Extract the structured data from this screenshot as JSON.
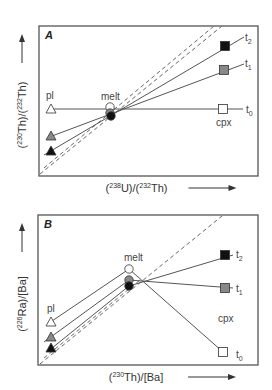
{
  "panels": [
    {
      "id": "A",
      "label": "A",
      "frame": {
        "x": 39,
        "y": 26,
        "w": 219,
        "h": 150
      },
      "xlabel": {
        "parts": [
          "(",
          "238",
          "U)/(",
          "232",
          "Th)"
        ]
      },
      "ylabel": {
        "parts": [
          "(",
          "230",
          "Th)/(",
          "232",
          "Th)"
        ]
      },
      "labels": {
        "pl": "pl",
        "melt": "melt",
        "cpx": "cpx",
        "t0": "t",
        "t1": "t",
        "t2": "t",
        "sub0": "0",
        "sub1": "1",
        "sub2": "2"
      },
      "dashed_lines": [
        {
          "x1": 40,
          "y1": 174,
          "x2": 222,
          "y2": 26
        },
        {
          "x1": 44,
          "y1": 168,
          "x2": 214,
          "y2": 26
        }
      ],
      "tie_lines": [
        {
          "name": "t0",
          "x1": 51,
          "y1": 109,
          "x2": 243,
          "y2": 109
        },
        {
          "name": "t1",
          "x1": 52,
          "y1": 136,
          "x2": 244,
          "y2": 64
        },
        {
          "name": "t2",
          "x1": 44,
          "y1": 155,
          "x2": 244,
          "y2": 37
        }
      ],
      "markers": [
        {
          "shape": "triangle",
          "fill": "#ffffff",
          "x": 51,
          "y": 109,
          "role": "pl-t0"
        },
        {
          "shape": "triangle",
          "fill": "#888888",
          "x": 51,
          "y": 136,
          "role": "pl-t1"
        },
        {
          "shape": "triangle",
          "fill": "#111111",
          "x": 51,
          "y": 151,
          "role": "pl-t2"
        },
        {
          "shape": "circle",
          "fill": "#ffffff",
          "x": 110,
          "y": 107,
          "role": "melt-t0"
        },
        {
          "shape": "circle",
          "fill": "#888888",
          "x": 110,
          "y": 113,
          "role": "melt-t1"
        },
        {
          "shape": "circle",
          "fill": "#111111",
          "x": 111,
          "y": 116,
          "role": "melt-t2"
        },
        {
          "shape": "square",
          "fill": "#ffffff",
          "x": 223,
          "y": 109,
          "role": "cpx-t0"
        },
        {
          "shape": "square",
          "fill": "#888888",
          "x": 224,
          "y": 70,
          "role": "cpx-t1"
        },
        {
          "shape": "square",
          "fill": "#111111",
          "x": 225,
          "y": 46,
          "role": "cpx-t2"
        }
      ],
      "text_positions": {
        "pl": [
          46,
          99
        ],
        "melt": [
          101,
          100
        ],
        "cpx": [
          216,
          126
        ],
        "t0": [
          246,
          113
        ],
        "t1": [
          245,
          67
        ],
        "t2": [
          245,
          41
        ]
      }
    },
    {
      "id": "B",
      "label": "B",
      "frame": {
        "x": 38,
        "y": 215,
        "w": 220,
        "h": 150
      },
      "xlabel": {
        "parts": [
          "(",
          "230",
          "Th)/[Ba]"
        ]
      },
      "ylabel": {
        "parts": [
          "(",
          "226",
          "Ra)/[Ba]"
        ]
      },
      "labels": {
        "pl": "pl",
        "melt": "melt",
        "cpx": "cpx",
        "t0": "t",
        "t1": "t",
        "t2": "t",
        "sub0": "0",
        "sub1": "1",
        "sub2": "2"
      },
      "dashed_lines": [
        {
          "x1": 40,
          "y1": 364,
          "x2": 222,
          "y2": 216
        },
        {
          "x1": 44,
          "y1": 358,
          "x2": 140,
          "y2": 280
        }
      ],
      "tie_lines": [
        {
          "name": "melt-pl-t0",
          "x1": 52,
          "y1": 321,
          "x2": 129,
          "y2": 269
        },
        {
          "name": "melt-pl-t1",
          "x1": 44,
          "y1": 342,
          "x2": 129,
          "y2": 280
        },
        {
          "name": "melt-pl-t2",
          "x1": 52,
          "y1": 348,
          "x2": 129,
          "y2": 286
        },
        {
          "name": "t0",
          "x1": 129,
          "y1": 269,
          "x2": 223,
          "y2": 352
        },
        {
          "name": "t1",
          "x1": 129,
          "y1": 280,
          "x2": 233,
          "y2": 288
        },
        {
          "name": "t2",
          "x1": 129,
          "y1": 286,
          "x2": 233,
          "y2": 255
        }
      ],
      "markers": [
        {
          "shape": "triangle",
          "fill": "#ffffff",
          "x": 51,
          "y": 322,
          "role": "pl-t0"
        },
        {
          "shape": "triangle",
          "fill": "#888888",
          "x": 51,
          "y": 337,
          "role": "pl-t1"
        },
        {
          "shape": "triangle",
          "fill": "#111111",
          "x": 51,
          "y": 348,
          "role": "pl-t2"
        },
        {
          "shape": "circle",
          "fill": "#ffffff",
          "x": 129,
          "y": 269,
          "role": "melt-t0"
        },
        {
          "shape": "circle",
          "fill": "#888888",
          "x": 129,
          "y": 280,
          "role": "melt-t1"
        },
        {
          "shape": "circle",
          "fill": "#111111",
          "x": 129,
          "y": 286,
          "role": "melt-t2"
        },
        {
          "shape": "square",
          "fill": "#ffffff",
          "x": 223,
          "y": 352,
          "role": "cpx-t0"
        },
        {
          "shape": "square",
          "fill": "#888888",
          "x": 225,
          "y": 288,
          "role": "cpx-t1"
        },
        {
          "shape": "square",
          "fill": "#111111",
          "x": 225,
          "y": 255,
          "role": "cpx-t2"
        }
      ],
      "text_positions": {
        "pl": [
          47,
          312
        ],
        "melt": [
          124,
          261
        ],
        "cpx": [
          218,
          322
        ],
        "t0": [
          236,
          358
        ],
        "t1": [
          236,
          292
        ],
        "t2": [
          236,
          258
        ]
      }
    }
  ]
}
